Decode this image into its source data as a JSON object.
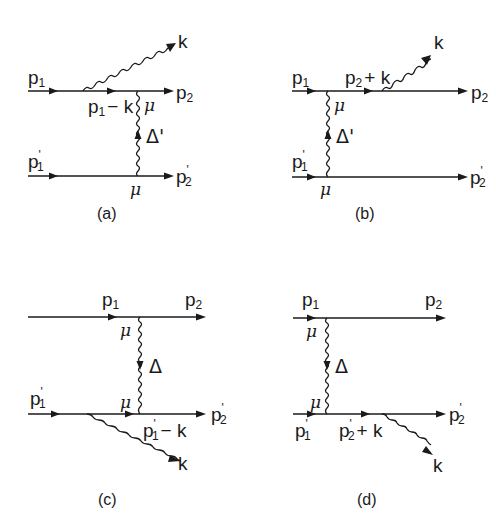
{
  "figure": {
    "panels": [
      {
        "id": "a",
        "caption": "(a)",
        "labels": {
          "in_top": "p",
          "in_top_sub": "1",
          "out_top": "p",
          "out_top_sub": "2",
          "in_bottom": "p",
          "in_bottom_sub": "1",
          "in_bottom_prime": "'",
          "out_bottom": "p",
          "out_bottom_sub": "2",
          "out_bottom_prime": "'",
          "internal": "p",
          "internal_sub": "1",
          "internal_rest": "− k",
          "photon": "k",
          "vertex_top": "μ",
          "vertex_bottom": "μ",
          "propagator": "Δ'"
        }
      },
      {
        "id": "b",
        "caption": "(b)",
        "labels": {
          "in_top": "p",
          "in_top_sub": "1",
          "out_top": "p",
          "out_top_sub": "2",
          "in_bottom": "p",
          "in_bottom_sub": "1",
          "in_bottom_prime": "'",
          "out_bottom": "p",
          "out_bottom_sub": "2",
          "out_bottom_prime": "'",
          "internal": "p",
          "internal_sub": "2",
          "internal_rest": "+ k",
          "photon": "k",
          "vertex_top": "μ",
          "vertex_bottom": "μ",
          "propagator": "Δ'"
        }
      },
      {
        "id": "c",
        "caption": "(c)",
        "labels": {
          "in_top": "p",
          "in_top_sub": "1",
          "out_top": "p",
          "out_top_sub": "2",
          "in_bottom": "p",
          "in_bottom_sub": "1",
          "in_bottom_prime": "'",
          "out_bottom": "p",
          "out_bottom_sub": "2",
          "out_bottom_prime": "'",
          "internal": "p",
          "internal_sub": "1",
          "internal_prime": "'",
          "internal_rest": "− k",
          "photon": "k",
          "vertex_top": "μ",
          "vertex_bottom": "μ",
          "propagator": "Δ"
        }
      },
      {
        "id": "d",
        "caption": "(d)",
        "labels": {
          "in_top": "p",
          "in_top_sub": "1",
          "out_top": "p",
          "out_top_sub": "2",
          "in_bottom": "p",
          "in_bottom_sub": "1",
          "in_bottom_prime": "'",
          "out_bottom": "p",
          "out_bottom_sub": "2",
          "out_bottom_prime": "'",
          "internal": "p",
          "internal_sub": "2",
          "internal_prime": "'",
          "internal_rest": "+ k",
          "photon": "k",
          "vertex_top": "μ",
          "vertex_bottom": "μ",
          "propagator": "Δ"
        }
      }
    ]
  }
}
